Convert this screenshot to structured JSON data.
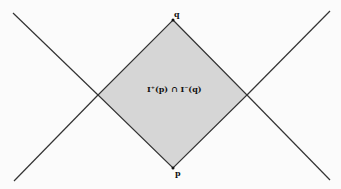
{
  "diagram": {
    "type": "causal-diamond",
    "labels": {
      "top_point": "q",
      "bottom_point": "p",
      "region": "I⁺(p) ∩ I⁻(q)"
    },
    "colors": {
      "background": "#fbfbfb",
      "region_fill": "#d6d6d6",
      "lines": "#333333",
      "text": "#111111"
    },
    "geometry": {
      "top": [
        173,
        20
      ],
      "bottom": [
        173,
        168
      ],
      "left": [
        98,
        95
      ],
      "right": [
        247,
        95
      ],
      "line_a": [
        [
          13,
          13
        ],
        [
          330,
          180
        ]
      ],
      "line_b": [
        [
          14,
          181
        ],
        [
          330,
          11
        ]
      ]
    }
  }
}
